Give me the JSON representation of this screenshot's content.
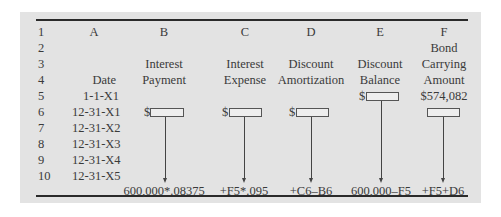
{
  "columns": [
    "A",
    "B",
    "C",
    "D",
    "E",
    "F"
  ],
  "row_numbers": [
    "1",
    "2",
    "3",
    "4",
    "5",
    "6",
    "7",
    "8",
    "9",
    "10"
  ],
  "headers": {
    "A": {
      "line2": "",
      "line3": "Date"
    },
    "B": {
      "line2": "Interest",
      "line3": "Payment"
    },
    "C": {
      "line2": "Interest",
      "line3": "Expense"
    },
    "D": {
      "line2": "Discount",
      "line3": "Amortization"
    },
    "E": {
      "line2": "Discount",
      "line3": "Balance"
    },
    "F": {
      "line1": "Bond",
      "line2": "Carrying",
      "line3": "Amount"
    }
  },
  "dates": [
    "1-1-X1",
    "12-31-X1",
    "12-31-X2",
    "12-31-X3",
    "12-31-X4",
    "12-31-X5"
  ],
  "cells": {
    "E5_prefix": "$",
    "F5_value": "$574,082",
    "B6_prefix": "$",
    "C6_prefix": "$",
    "D6_prefix": "$"
  },
  "formulas": {
    "B": "600,000*.08375",
    "C": "+F5*.095",
    "D": "+C6–B6",
    "E": "600,000–F5",
    "F": "+F5+D6"
  },
  "colors": {
    "panel_background": "#e3e3e3",
    "rule": "#2a2a2a",
    "text": "#3a3a3a"
  }
}
